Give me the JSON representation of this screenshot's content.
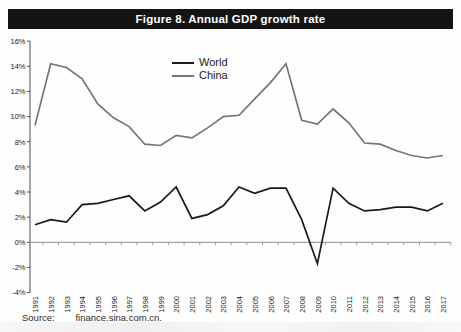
{
  "title": "Figure 8.  Annual GDP growth rate",
  "source": {
    "label": "Source:",
    "value": "finance.sina.com.cn."
  },
  "colors": {
    "title_bar_bg": "#141414",
    "title_text": "#ffffff",
    "world_line": "#1a1a1a",
    "china_line": "#757575",
    "axis": "#4d4d4d",
    "zero_line": "#8c8c8c",
    "tick_label": "#1a1a1a"
  },
  "chart_data": {
    "type": "line",
    "title": "Figure 8. Annual GDP growth rate",
    "x": [
      1991,
      1992,
      1993,
      1994,
      1995,
      1996,
      1997,
      1998,
      1999,
      2000,
      2001,
      2002,
      2003,
      2004,
      2005,
      2006,
      2007,
      2008,
      2009,
      2010,
      2011,
      2012,
      2013,
      2014,
      2015,
      2016,
      2017
    ],
    "series": [
      {
        "name": "World",
        "color": "#1a1a1a",
        "values": [
          1.4,
          1.8,
          1.6,
          3.0,
          3.1,
          3.4,
          3.7,
          2.5,
          3.2,
          4.4,
          1.9,
          2.2,
          2.9,
          4.4,
          3.9,
          4.3,
          4.3,
          1.8,
          -1.7,
          4.3,
          3.1,
          2.5,
          2.6,
          2.8,
          2.8,
          2.5,
          3.1
        ]
      },
      {
        "name": "China",
        "color": "#757575",
        "values": [
          9.3,
          14.2,
          13.9,
          13.0,
          11.0,
          9.9,
          9.2,
          7.8,
          7.7,
          8.5,
          8.3,
          9.1,
          10.0,
          10.1,
          11.4,
          12.7,
          14.2,
          9.7,
          9.4,
          10.6,
          9.5,
          7.9,
          7.8,
          7.3,
          6.9,
          6.7,
          6.9
        ]
      }
    ],
    "ylim": [
      -4,
      16
    ],
    "ytick_step": 2,
    "ytick_labels": [
      "-4%",
      "-2%",
      "0%",
      "2%",
      "4%",
      "6%",
      "8%",
      "10%",
      "12%",
      "14%",
      "16%"
    ],
    "grid": false,
    "legend_position": "upper-center",
    "x_axis_crosses_at": 0
  }
}
